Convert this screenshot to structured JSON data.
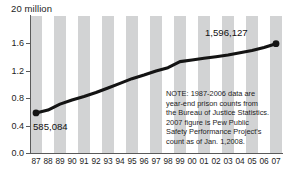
{
  "chart_data": {
    "type": "line",
    "title": "20 million",
    "xlabel": "",
    "ylabel": "",
    "ylim": [
      0.0,
      2.0
    ],
    "ytick_labels": [
      "0.0",
      "0.4",
      "0.8",
      "1.2",
      "1.6"
    ],
    "ytick_values": [
      0.0,
      0.4,
      0.8,
      1.2,
      1.6
    ],
    "grid": false,
    "legend": "none",
    "categories": [
      "87",
      "88",
      "89",
      "90",
      "91",
      "92",
      "93",
      "94",
      "95",
      "96",
      "97",
      "98",
      "99",
      "00",
      "01",
      "02",
      "03",
      "04",
      "05",
      "06",
      "07"
    ],
    "x_full_years": [
      1987,
      1988,
      1989,
      1990,
      1991,
      1992,
      1993,
      1994,
      1995,
      1996,
      1997,
      1998,
      1999,
      2000,
      2001,
      2002,
      2003,
      2004,
      2005,
      2006,
      2007
    ],
    "series": [
      {
        "name": "U.S. state and federal prison population",
        "units": "millions",
        "values": [
          0.585,
          0.627,
          0.713,
          0.774,
          0.826,
          0.883,
          0.949,
          1.016,
          1.085,
          1.138,
          1.197,
          1.246,
          1.334,
          1.358,
          1.382,
          1.406,
          1.432,
          1.465,
          1.497,
          1.541,
          1.596
        ]
      }
    ],
    "point_labels": [
      {
        "category": "87",
        "text": "585,084",
        "value": 0.585084,
        "position": "below-right"
      },
      {
        "category": "07",
        "text": "1,596,127",
        "value": 1.596127,
        "position": "above-left"
      }
    ],
    "markers": [
      "87",
      "07"
    ],
    "annotations": [
      "NOTE: 1987-2006 data are",
      "year-end prison counts from",
      "the Bureau of Justice Statistics.",
      "2007 figure is Pew Public",
      "Safety Performance Project's",
      "count as of Jan. 1,2008."
    ],
    "colors": {
      "line": "#141414",
      "stripe": "#d2d3d4",
      "background": "#ffffff",
      "axis": "#5a5a5a",
      "text": "#1d1d1d"
    }
  }
}
